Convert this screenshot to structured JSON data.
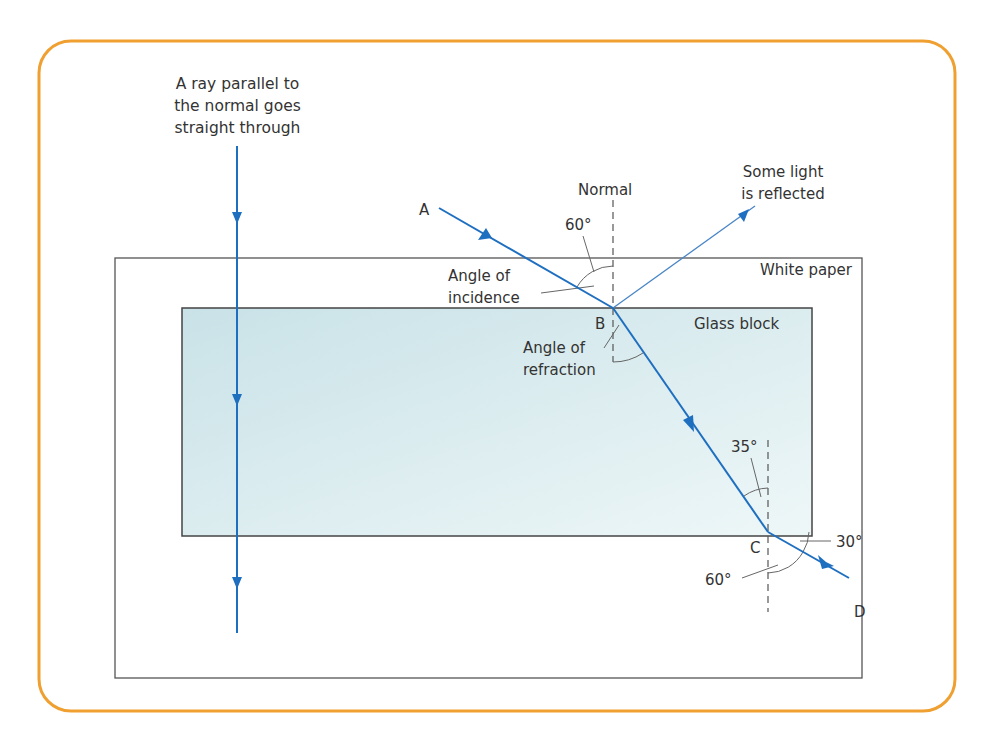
{
  "colors": {
    "frame": "#F0A030",
    "ray": "#1F6FC0",
    "reflected_ray": "#4A86C8",
    "outline": "#555555",
    "glass_fill_top": "#CFE6EA",
    "glass_fill_bottom": "#EAF5F6",
    "text": "#333333"
  },
  "labels": {
    "straight_ray_note_line1": "A ray parallel to",
    "straight_ray_note_line2": "the normal goes",
    "straight_ray_note_line3": "straight through",
    "normal": "Normal",
    "point_a": "A",
    "point_b": "B",
    "point_c": "C",
    "point_d": "D",
    "reflected_line1": "Some light",
    "reflected_line2": "is reflected",
    "white_paper": "White paper",
    "glass_block": "Glass block",
    "incidence_line1": "Angle of",
    "incidence_line2": "incidence",
    "refraction_line1": "Angle of",
    "refraction_line2": "refraction",
    "angle_incidence_value": "60°",
    "angle_inside_value": "35°",
    "angle_emergent_value": "60°",
    "angle_surface_value": "30°"
  }
}
